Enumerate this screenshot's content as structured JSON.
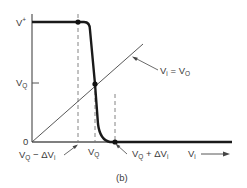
{
  "figure": {
    "caption": "(b)",
    "type": "transfer-characteristic",
    "y_axis": {
      "top_label_base": "V",
      "top_label_sup": "+",
      "mid_label_base": "V",
      "mid_label_sub": "Q",
      "zero_label": "0"
    },
    "x_axis": {
      "label_base": "V",
      "label_sub": "i",
      "arrow": "→"
    },
    "x_markers": [
      {
        "base": "V",
        "sub": "Q",
        "op": " − ΔV",
        "sub2": "i"
      },
      {
        "base": "V",
        "sub": "Q"
      },
      {
        "base": "V",
        "sub": "Q",
        "op": " + ΔV",
        "sub2": "i"
      }
    ],
    "line_label": {
      "lhs_base": "V",
      "lhs_sub": "i",
      "eq": " = ",
      "rhs_base": "V",
      "rhs_sub": "O"
    },
    "colors": {
      "curve": "#1a1a1a",
      "axes": "#555555",
      "dashed": "#777777",
      "text": "#3a3a3a"
    }
  }
}
